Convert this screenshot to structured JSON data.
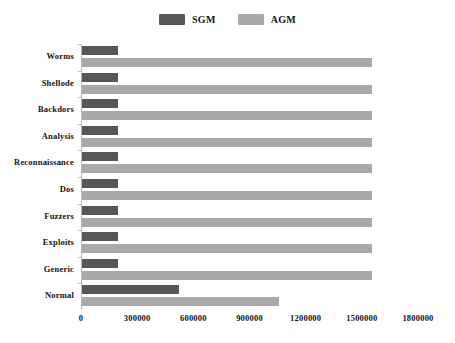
{
  "legend": {
    "position": "top-center",
    "entries": [
      {
        "label": "SGM",
        "color": "#575757",
        "swatch_name": "legend-swatch-sgm"
      },
      {
        "label": "AGM",
        "color": "#a9a9a9",
        "swatch_name": "legend-swatch-agm"
      }
    ]
  },
  "chart_data": {
    "type": "bar",
    "orientation": "horizontal",
    "title": "",
    "subtitle": "",
    "xlabel": "",
    "ylabel": "",
    "grid": false,
    "legend_position": "top-center",
    "xlim": [
      0,
      1800000
    ],
    "xticks": [
      0,
      300000,
      600000,
      900000,
      1200000,
      1500000,
      1800000
    ],
    "xtick_labels": [
      "0",
      "300000",
      "600000",
      "900000",
      "1200000",
      "1500000",
      "1800000"
    ],
    "categories": [
      "Worms",
      "Shellode",
      "Backdors",
      "Analysis",
      "Reconnaissance",
      "Dos",
      "Fuzzers",
      "Exploits",
      "Generic",
      "Normal"
    ],
    "series": [
      {
        "name": "SGM",
        "color": "#575757",
        "values": [
          190000,
          190000,
          190000,
          190000,
          190000,
          190000,
          190000,
          190000,
          190000,
          519000
        ]
      },
      {
        "name": "AGM",
        "color": "#a9a9a9",
        "values": [
          1550000,
          1550000,
          1550000,
          1550000,
          1550000,
          1550000,
          1550000,
          1550000,
          1550000,
          1053000
        ]
      }
    ]
  }
}
